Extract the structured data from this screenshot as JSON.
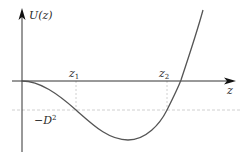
{
  "diagram": {
    "y_axis_label": "U(z)",
    "x_axis_label": "z",
    "markers": {
      "z1": {
        "base": "z",
        "sub": "1"
      },
      "z2": {
        "base": "z",
        "sub": "2"
      }
    },
    "level_label": {
      "prefix": "−D",
      "sup": "2"
    },
    "colors": {
      "axis": "#222222",
      "curve": "#555555",
      "dashed": "#bdbdbd",
      "text": "#2a2a2a"
    }
  }
}
